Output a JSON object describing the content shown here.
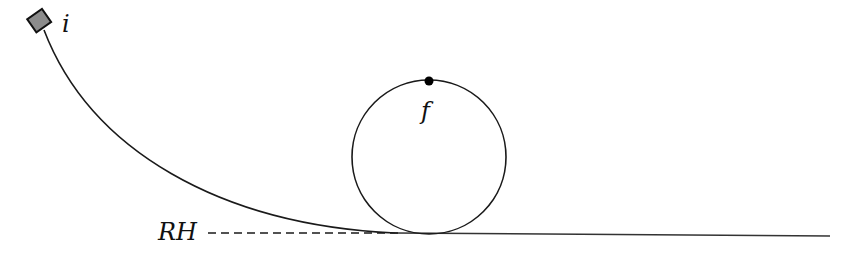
{
  "diagram": {
    "labels": {
      "initial": "i",
      "final": "f",
      "reference_height": "RH"
    },
    "colors": {
      "stroke": "#1a1a1a",
      "block_fill": "#8c8c8c",
      "background": "#ffffff"
    }
  }
}
